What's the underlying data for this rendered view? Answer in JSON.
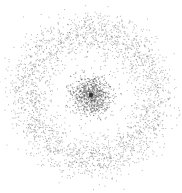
{
  "chart_data": {
    "type": "scatter",
    "title": "",
    "xlabel": "",
    "ylabel": "",
    "grid": false,
    "legend": null,
    "axes_visible": false,
    "center_px": [
      91,
      95
    ],
    "series": [
      {
        "name": "inner-cluster",
        "shape": "blob",
        "count": 900,
        "radius_mean": 0,
        "radius_sigma": 10,
        "color": "#555555",
        "opacity": 0.55
      },
      {
        "name": "outer-ring",
        "shape": "ring",
        "count": 2600,
        "radius_mean": 64,
        "radius_sigma": 11,
        "color": "#666666",
        "opacity": 0.45
      }
    ],
    "point_size": 1,
    "canvas": {
      "width": 182,
      "height": 193,
      "background": "#ffffff"
    }
  }
}
